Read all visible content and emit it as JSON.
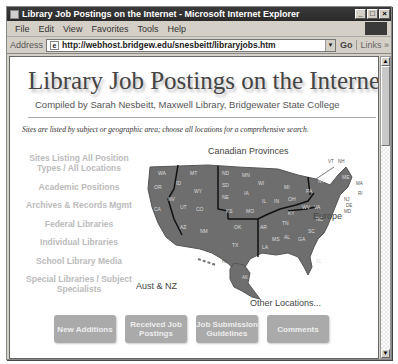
{
  "window": {
    "title": "Library Job Postings on the Internet - Microsoft Internet Explorer",
    "controls": {
      "minimize": "_",
      "maximize": "□",
      "close": "×"
    }
  },
  "menu": [
    "File",
    "Edit",
    "View",
    "Favorites",
    "Tools",
    "Help"
  ],
  "address": {
    "label": "Address",
    "url": "http://webhost.bridgew.edu/snesbeitt/libraryjobs.htm",
    "go": "Go",
    "links": "Links »"
  },
  "page": {
    "title": "Library Job Postings on the Internet",
    "subtitle": "Compiled by Sarah Nesbeitt, Maxwell Library, Bridgewater State College",
    "note": "Sites are listed by subject or geographic area; choose all locations for a comprehensive search.",
    "categories": [
      "Sites Listing All Position Types / All Locations",
      "Academic Positions",
      "Archives & Records Mgmt",
      "Federal Libraries",
      "Individual Libraries",
      "School Library Media",
      "Special Libraries / Subject Specialists"
    ],
    "map": {
      "labels": {
        "canada": "Canadian Provinces",
        "europe": "Europe",
        "aust": "Aust & NZ",
        "other": "Other Locations..."
      },
      "states": [
        "WA",
        "OR",
        "CA",
        "ID",
        "NV",
        "MT",
        "WY",
        "UT",
        "AZ",
        "CO",
        "NM",
        "ND",
        "SD",
        "NE",
        "KS",
        "OK",
        "TX",
        "MN",
        "IA",
        "MO",
        "AR",
        "LA",
        "WI",
        "IL",
        "MS",
        "MI",
        "IN",
        "KY",
        "TN",
        "AL",
        "OH",
        "GA",
        "FL",
        "PA",
        "WV",
        "VA",
        "NC",
        "SC",
        "NY",
        "VT",
        "NH",
        "ME",
        "MA",
        "RI",
        "CT",
        "NJ",
        "DE",
        "MD",
        "HI",
        "AK"
      ]
    },
    "buttons": [
      "New Additions",
      "Received Job Postings",
      "Job Submission Guidelines",
      "Comments"
    ]
  }
}
